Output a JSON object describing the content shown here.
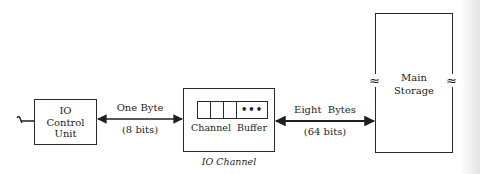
{
  "diagram": {
    "type": "block-diagram",
    "nodes": {
      "io_control_unit": {
        "label_lines": [
          "IO",
          "Control",
          "Unit"
        ]
      },
      "io_channel": {
        "buffer_label": "Channel  Buffer",
        "buffer_cells": 3,
        "buffer_continuation": "•••",
        "caption": "IO Channel"
      },
      "main_storage": {
        "label_lines": [
          "Main",
          "Storage"
        ],
        "break_symbol": "≈"
      }
    },
    "edges": {
      "control_to_channel": {
        "label_top": "One Byte",
        "label_bottom": "(8 bits)",
        "direction": "bidirectional"
      },
      "channel_to_storage": {
        "label_top": "Eight  Bytes",
        "label_bottom": "(64 bits)",
        "direction": "bidirectional"
      },
      "external_input": {
        "symbol": "~"
      }
    },
    "colors": {
      "line": "#2a2a2a",
      "text": "#1f1f1f",
      "background": "#ffffff"
    }
  }
}
